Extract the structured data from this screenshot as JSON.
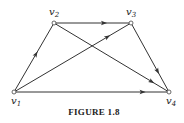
{
  "figure": {
    "caption": "FIGURE 1.8",
    "nodes": [
      {
        "id": "v1",
        "label": "v",
        "sub": "1",
        "x": 14,
        "y": 92,
        "lx": 11,
        "ly": 104
      },
      {
        "id": "v2",
        "label": "v",
        "sub": "2",
        "x": 54,
        "y": 23,
        "lx": 49,
        "ly": 15
      },
      {
        "id": "v3",
        "label": "v",
        "sub": "3",
        "x": 131,
        "y": 23,
        "lx": 126,
        "ly": 15
      },
      {
        "id": "v4",
        "label": "v",
        "sub": "4",
        "x": 169,
        "y": 92,
        "lx": 166,
        "ly": 104
      }
    ],
    "edges": [
      {
        "from": "v1",
        "to": "v2",
        "arrow_at": 0.55
      },
      {
        "from": "v2",
        "to": "v3",
        "arrow_at": 0.65
      },
      {
        "from": "v1",
        "to": "v3",
        "arrow_at": 0.8
      },
      {
        "from": "v2",
        "to": "v4",
        "arrow_at": 0.85
      },
      {
        "from": "v3",
        "to": "v4",
        "arrow_at": 0.7
      },
      {
        "from": "v1",
        "to": "v4",
        "arrow_at": 0.83
      }
    ],
    "colors": {
      "stroke": "#333333",
      "background": "#ffffff"
    }
  }
}
